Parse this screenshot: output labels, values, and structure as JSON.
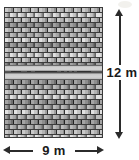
{
  "diagram": {
    "kind": "brick-wall-dimension-diagram",
    "shape": "rectangle",
    "width_label": "9 m",
    "height_label": "12 m",
    "width_value": 9,
    "height_value": 12,
    "unit": "m",
    "texture": "brick-masonry",
    "band": {
      "present": true,
      "description": "lighter horizontal concrete course",
      "position_from_top_fraction": 0.44
    },
    "colors": {
      "brick_light": "#c9c9c9",
      "brick_mid": "#9a9a9a",
      "brick_dark": "#6f6f6f",
      "mortar": "#2f2f2f",
      "outline": "#3a3a3a",
      "band_light": "#d2d2d2",
      "arrow": "#2b2b2b",
      "label_text": "#1a1a1a",
      "background": "#ffffff"
    },
    "icons": {
      "vertical_dimension": "double-headed-arrow-vertical-icon",
      "horizontal_dimension": "double-headed-arrow-horizontal-icon"
    }
  }
}
